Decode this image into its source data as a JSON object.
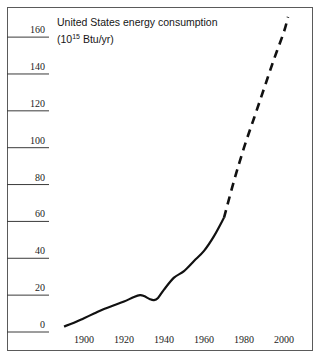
{
  "chart_data": {
    "type": "line",
    "title": "United States energy consumption",
    "subtitle_prefix": "(10",
    "subtitle_exponent": "15",
    "subtitle_suffix": " Btu/yr)",
    "xlabel": "",
    "ylabel": "",
    "xlim": [
      1885,
      2008
    ],
    "ylim": [
      0,
      172
    ],
    "grid": false,
    "legend": false,
    "yticks": [
      0,
      20,
      40,
      60,
      80,
      100,
      120,
      140,
      160
    ],
    "ytick_labels": [
      "0",
      "20",
      "40",
      "60",
      "80",
      "100",
      "120",
      "140",
      "160"
    ],
    "xticks": [
      1900,
      1920,
      1940,
      1960,
      1980,
      2000
    ],
    "xtick_labels": [
      "1900",
      "1920",
      "1940",
      "1960",
      "1980",
      "2000"
    ],
    "series": [
      {
        "name": "Historical consumption",
        "style": "solid",
        "color": "#111111",
        "x": [
          1890,
          1895,
          1900,
          1905,
          1910,
          1915,
          1920,
          1925,
          1928,
          1930,
          1933,
          1935,
          1937,
          1940,
          1945,
          1950,
          1955,
          1960,
          1965,
          1970
        ],
        "y": [
          3,
          5,
          7.5,
          10,
          12.5,
          14.5,
          16.5,
          19,
          20,
          19.5,
          17.8,
          17.3,
          18.5,
          23,
          29.5,
          33,
          38.5,
          44,
          52,
          62
        ]
      },
      {
        "name": "Projected consumption",
        "style": "dashed",
        "color": "#111111",
        "x": [
          1970,
          1975,
          1980,
          1985,
          1990,
          1995,
          2000,
          2002
        ],
        "y": [
          62,
          82,
          100,
          116,
          132,
          148,
          163,
          171
        ]
      }
    ]
  },
  "axes": {
    "ytick_style": "horizontal rule under each label spanning from frame edge",
    "xtick_style": "labels only, no tick marks"
  },
  "colors": {
    "frame": "#5a5a5a",
    "tick_rule": "#3a3a3a",
    "line": "#111111",
    "text": "#1c1c1c",
    "background": "#ffffff"
  }
}
